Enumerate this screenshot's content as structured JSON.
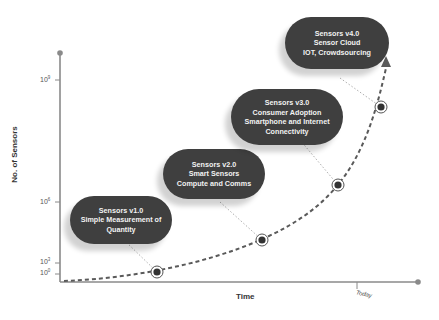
{
  "diagram": {
    "type": "sensor-evolution-timeline",
    "y_axis": {
      "label": "No. of Sensors",
      "ticks": [
        {
          "base": "10",
          "exp": "9"
        },
        {
          "base": "10",
          "exp": "6"
        },
        {
          "base": "10",
          "exp": "3"
        },
        {
          "base": "10",
          "exp": "0"
        }
      ]
    },
    "x_axis": {
      "label": "Time",
      "marker": "Today"
    },
    "stages": [
      {
        "title": "Sensors v1.0",
        "line2": "Simple Measurement of",
        "line3": "Quantity"
      },
      {
        "title": "Sensors v2.0",
        "line2": "Smart Sensors",
        "line3": "Compute and Comms"
      },
      {
        "title": "Sensors v3.0",
        "line2": "Consumer Adoption",
        "line3": "Smartphone and Internet",
        "line4": "Connectivity"
      },
      {
        "title": "Sensors v4.0",
        "line2": "Sensor Cloud",
        "line3": "IOT, Crowdsourcing"
      }
    ],
    "colors": {
      "pill": "#3f3f3f",
      "pill_text": "#f2f2f2",
      "axis": "#8a8a8a",
      "curve": "#5a5a5a"
    }
  }
}
